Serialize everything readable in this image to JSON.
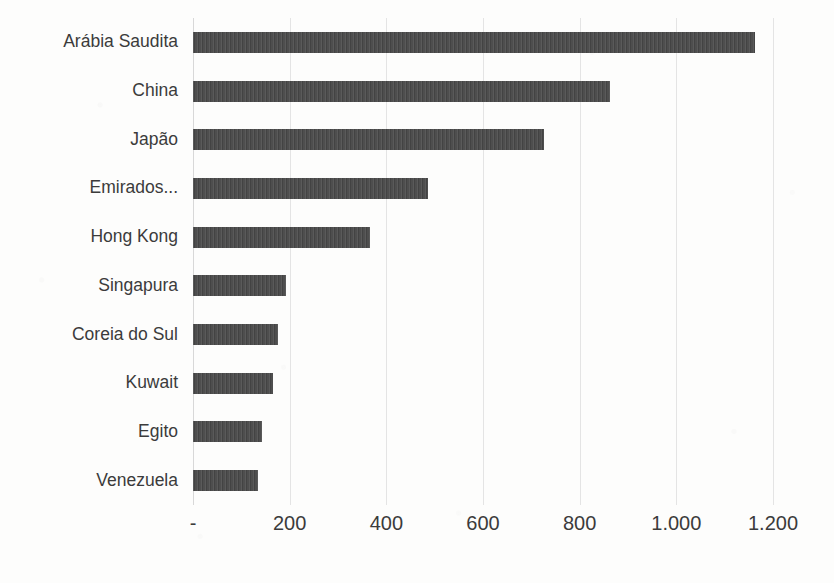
{
  "chart_data": {
    "type": "bar",
    "orientation": "horizontal",
    "title": "",
    "subtitle": "",
    "xlabel": "",
    "ylabel": "",
    "categories": [
      "Arábia Saudita",
      "China",
      "Japão",
      "Emirados...",
      "Hong Kong",
      "Singapura",
      "Coreia do Sul",
      "Kuwait",
      "Egito",
      "Venezuela"
    ],
    "values": [
      1163,
      863,
      726,
      486,
      366,
      192,
      176,
      166,
      143,
      134
    ],
    "series": [
      {
        "name": "",
        "values": [
          1163,
          863,
          726,
          486,
          366,
          192,
          176,
          166,
          143,
          134
        ]
      }
    ],
    "xlim": [
      0,
      1200
    ],
    "x_ticks": [
      0,
      200,
      400,
      600,
      800,
      1000,
      1200
    ],
    "x_tick_labels": [
      "-",
      "200",
      "400",
      "600",
      "800",
      "1.000",
      "1.200"
    ],
    "grid": "vertical",
    "legend": "none",
    "bar_color": "#474747",
    "gridline_color": "#e4e4e4",
    "text_color": "#3b3b3b",
    "background_color": "#fdfdfc"
  }
}
